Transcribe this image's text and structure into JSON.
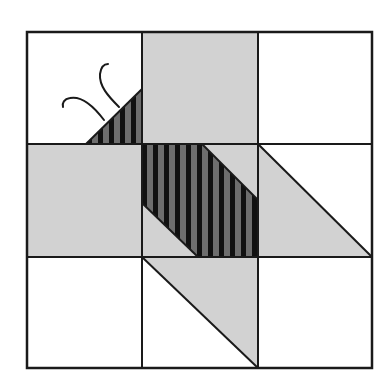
{
  "figure": {
    "type": "quilt-block-diagram",
    "grid": {
      "rows": 3,
      "cols": 3,
      "x_lines": [
        27,
        142,
        258,
        372
      ],
      "y_lines": [
        32,
        144,
        257,
        368
      ]
    },
    "colors": {
      "background": "#ffffff",
      "light_fill": "#d2d2d2",
      "stripe_dark": "#111111",
      "stripe_light": "#6e6e6e",
      "outline": "#1a1a1a"
    },
    "stripe_period": 11,
    "cells": [
      {
        "row": 0,
        "col": 0,
        "fill": "white",
        "feature": "striped-triangle-with-antennae"
      },
      {
        "row": 0,
        "col": 1,
        "fill": "light"
      },
      {
        "row": 0,
        "col": 2,
        "fill": "white"
      },
      {
        "row": 1,
        "col": 0,
        "fill": "light"
      },
      {
        "row": 1,
        "col": 1,
        "fill": "light",
        "feature": "striped-parallelogram"
      },
      {
        "row": 1,
        "col": 2,
        "fill": "white",
        "feature": "light-triangle-lower-left"
      },
      {
        "row": 2,
        "col": 0,
        "fill": "white"
      },
      {
        "row": 2,
        "col": 1,
        "fill": "white",
        "feature": "light-triangle-upper-right"
      },
      {
        "row": 2,
        "col": 2,
        "fill": "white"
      }
    ]
  }
}
